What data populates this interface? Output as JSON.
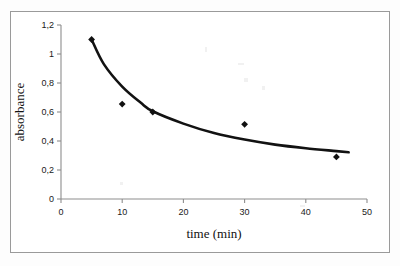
{
  "chart_data": {
    "type": "scatter",
    "title": "",
    "subtitle": "",
    "xlabel": "time (min)",
    "ylabel": "absorbance",
    "xlim": [
      0,
      50
    ],
    "ylim": [
      0,
      1.2
    ],
    "grid": false,
    "legend": "none",
    "x_tick_labels": [
      "0",
      "10",
      "20",
      "30",
      "40",
      "50"
    ],
    "x_tick_values": [
      0,
      10,
      20,
      30,
      40,
      50
    ],
    "y_tick_labels": [
      "0",
      "0,2",
      "0,4",
      "0,6",
      "0,8",
      "1",
      "1,2"
    ],
    "y_tick_values": [
      0,
      0.2,
      0.4,
      0.6,
      0.8,
      1.0,
      1.2
    ],
    "decimal_separator": ",",
    "marker_style": "filled-diamond",
    "marker_color": "#111111",
    "trendline_color": "#111111",
    "trendline_type": "power-decay",
    "series": [
      {
        "name": "absorbance vs time",
        "x": [
          5,
          10,
          15,
          30,
          45
        ],
        "values": [
          1.1,
          0.655,
          0.6,
          0.515,
          0.29
        ]
      }
    ],
    "trendline_points": [
      {
        "x": 5,
        "y": 1.1
      },
      {
        "x": 7,
        "y": 0.93
      },
      {
        "x": 10,
        "y": 0.775
      },
      {
        "x": 13,
        "y": 0.665
      },
      {
        "x": 15,
        "y": 0.605
      },
      {
        "x": 20,
        "y": 0.52
      },
      {
        "x": 25,
        "y": 0.455
      },
      {
        "x": 30,
        "y": 0.41
      },
      {
        "x": 35,
        "y": 0.375
      },
      {
        "x": 40,
        "y": 0.35
      },
      {
        "x": 45,
        "y": 0.33
      },
      {
        "x": 47,
        "y": 0.322
      }
    ]
  },
  "axes": {
    "x_title": "time (min)",
    "y_title": "absorbance"
  }
}
